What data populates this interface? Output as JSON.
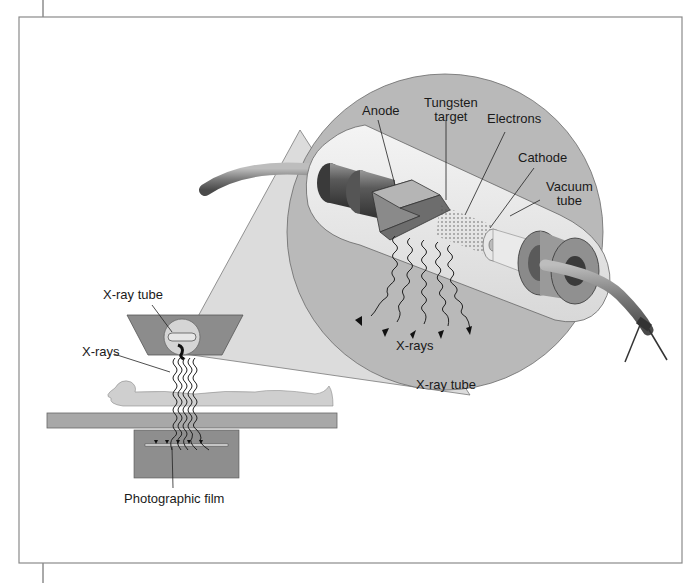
{
  "figure": {
    "type": "labeled-illustration",
    "colors": {
      "background": "#ffffff",
      "frame": "#8a8a8a",
      "inset_circle": "#b9b9b9",
      "funnel": "#dcdcdc",
      "housing": "#8c8c8c",
      "table": "#a8a8a8",
      "film_box": "#8e8e8e",
      "patient": "#cfcfcf"
    }
  },
  "labels": {
    "xray_tube_left": "X-ray tube",
    "xrays_left": "X-rays",
    "photographic_film": "Photographic film",
    "anode": "Anode",
    "tungsten_target_1": "Tungsten",
    "tungsten_target_2": "target",
    "electrons": "Electrons",
    "cathode": "Cathode",
    "vacuum_tube_1": "Vacuum",
    "vacuum_tube_2": "tube",
    "xrays_inset": "X-rays",
    "xray_tube_inset": "X-ray tube"
  }
}
